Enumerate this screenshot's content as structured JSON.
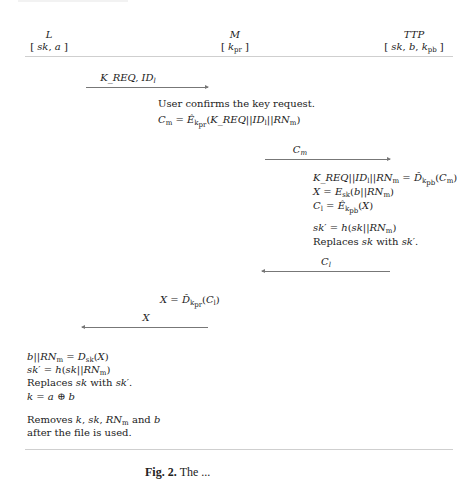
{
  "figure": {
    "parties": [
      {
        "name": "L",
        "keys": "[ sk, a ]"
      },
      {
        "name": "M",
        "keys": "[ k_pr ]"
      },
      {
        "name": "TTP",
        "keys": "[ sk, b, k_pb ]"
      }
    ],
    "messages": [
      {
        "label": "K_REQ, ID_l",
        "from": "L",
        "to": "M",
        "direction": "right"
      },
      {
        "label": "C_m",
        "from": "M",
        "to": "TTP",
        "direction": "right"
      },
      {
        "label": "C_l",
        "from": "TTP",
        "to": "M",
        "direction": "left"
      },
      {
        "label": "X",
        "from": "M",
        "to": "L",
        "direction": "left"
      }
    ],
    "steps": {
      "m_step1": [
        "User confirms the key request.",
        "C_m = Ê_{k_pr}(K_REQ||ID_l||RN_m)"
      ],
      "ttp_step1": [
        "K_REQ||ID_l||RN_m = D̂_{k_pb}(C_m)",
        "X = E_sk(b||RN_m)",
        "C_l = Ê_{k_pb}(X)"
      ],
      "ttp_step2": [
        "sk' = h(sk||RN_m)",
        "Replaces sk with sk'."
      ],
      "m_step2": [
        "X = D̂_{k_pr}(C_l)"
      ],
      "l_step1": [
        "b||RN_m = D_sk(X)",
        "sk' = h(sk||RN_m)",
        "Replaces sk with sk'.",
        "k = a ⊕ b"
      ],
      "l_step2": [
        "Removes k, sk, RN_m and b",
        "after the file is used."
      ]
    },
    "caption": {
      "label": "Fig. 2.",
      "text": "The ..."
    }
  }
}
